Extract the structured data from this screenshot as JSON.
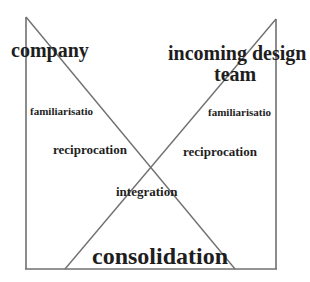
{
  "diagram": {
    "colors": {
      "line": "#707070",
      "text": "#1e1e1e",
      "background": "#ffffff"
    },
    "labels": {
      "left_party": "company",
      "right_party_line1": "incoming design",
      "right_party_line2": "team",
      "left_stage1": "familiarisatio",
      "right_stage1": "familiarisatio",
      "left_stage2": "reciprocation",
      "right_stage2": "reciprocation",
      "center_stage": "integration",
      "final_stage": "consolidation"
    },
    "shapes": {
      "left_vertical": {
        "x1": 26,
        "y1": 17,
        "x2": 26,
        "y2": 269
      },
      "right_vertical": {
        "x1": 276,
        "y1": 19,
        "x2": 276,
        "y2": 269
      },
      "bottom_line": {
        "x1": 26,
        "y1": 269,
        "x2": 276,
        "y2": 269
      },
      "left_diagonal": {
        "x1": 26,
        "y1": 17,
        "x2": 235,
        "y2": 269
      },
      "right_diagonal": {
        "x1": 276,
        "y1": 19,
        "x2": 65,
        "y2": 269
      }
    }
  }
}
